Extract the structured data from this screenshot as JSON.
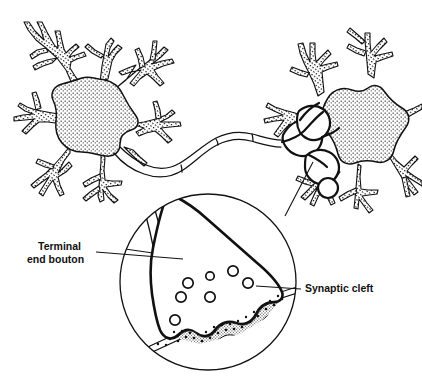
{
  "figure": {
    "type": "biological-line-diagram",
    "background_color": "#ffffff",
    "ink_color": "#111111"
  },
  "labels": {
    "terminal_bouton": {
      "line1": "Terminal",
      "line2": "end bouton",
      "full": "Terminal end bouton",
      "x": 38,
      "y": 249
    },
    "synaptic_cleft": {
      "text": "Synaptic cleft",
      "x": 305,
      "y": 292
    }
  },
  "structures": {
    "presynaptic_neuron": {
      "name": "Presynaptic neuron",
      "soma_fill": "stipple",
      "soma_center_x": 88,
      "soma_center_y": 113
    },
    "postsynaptic_neuron": {
      "name": "Postsynaptic neuron",
      "soma_fill": "stipple",
      "soma_center_x": 350,
      "soma_center_y": 110
    },
    "axon": {
      "name": "Axon",
      "style": "double-line"
    },
    "magnifier": {
      "name": "Magnified synapse inset",
      "center_x": 208,
      "center_y": 282,
      "radius": 88
    },
    "vesicles": {
      "name": "Synaptic vesicles",
      "count": 7,
      "points": [
        {
          "cx": 233,
          "cy": 271,
          "r": 5
        },
        {
          "cx": 210,
          "cy": 276,
          "r": 4
        },
        {
          "cx": 248,
          "cy": 283,
          "r": 5
        },
        {
          "cx": 188,
          "cy": 283,
          "r": 5
        },
        {
          "cx": 181,
          "cy": 297,
          "r": 5
        },
        {
          "cx": 210,
          "cy": 297,
          "r": 5
        },
        {
          "cx": 175,
          "cy": 320,
          "r": 5
        }
      ]
    },
    "cleft": {
      "name": "Synaptic cleft stipple band",
      "style": "dotted-band"
    }
  },
  "leader_lines": {
    "terminal_bouton": {
      "x1": 96,
      "y1": 253,
      "x2": 183,
      "y2": 259
    },
    "synaptic_cleft": {
      "x1": 300,
      "y1": 289,
      "x2": 258,
      "y2": 286
    },
    "magnifier_to_neuron": {
      "x1": 285,
      "y1": 216,
      "x2": 312,
      "y2": 162
    }
  }
}
